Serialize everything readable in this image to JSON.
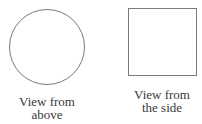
{
  "diagram": {
    "views": [
      {
        "shape": "circle",
        "caption_lines": [
          "View from",
          "above"
        ]
      },
      {
        "shape": "square",
        "caption_lines": [
          "View from",
          "the side"
        ]
      }
    ],
    "colors": {
      "outline": "#7a7a7a",
      "text": "#3a3a3a",
      "background": "#ffffff"
    }
  }
}
